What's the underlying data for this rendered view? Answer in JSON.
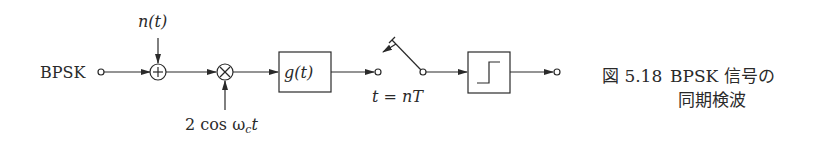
{
  "diagram": {
    "input_label": "BPSK",
    "noise_label": "n(t)",
    "carrier_label": "2 cos ω",
    "carrier_subscript": "c",
    "carrier_suffix": "t",
    "adder_symbol": "+",
    "multiplier_symbol": "×",
    "filter_label": "g(t)",
    "sampler_label": "t = nT",
    "decision_block": "step-function"
  },
  "caption": {
    "figure_number": "図 5.18",
    "line1": "BPSK 信号の",
    "line2": "同期検波"
  },
  "colors": {
    "stroke": "#2a2a2a",
    "background": "#ffffff"
  }
}
